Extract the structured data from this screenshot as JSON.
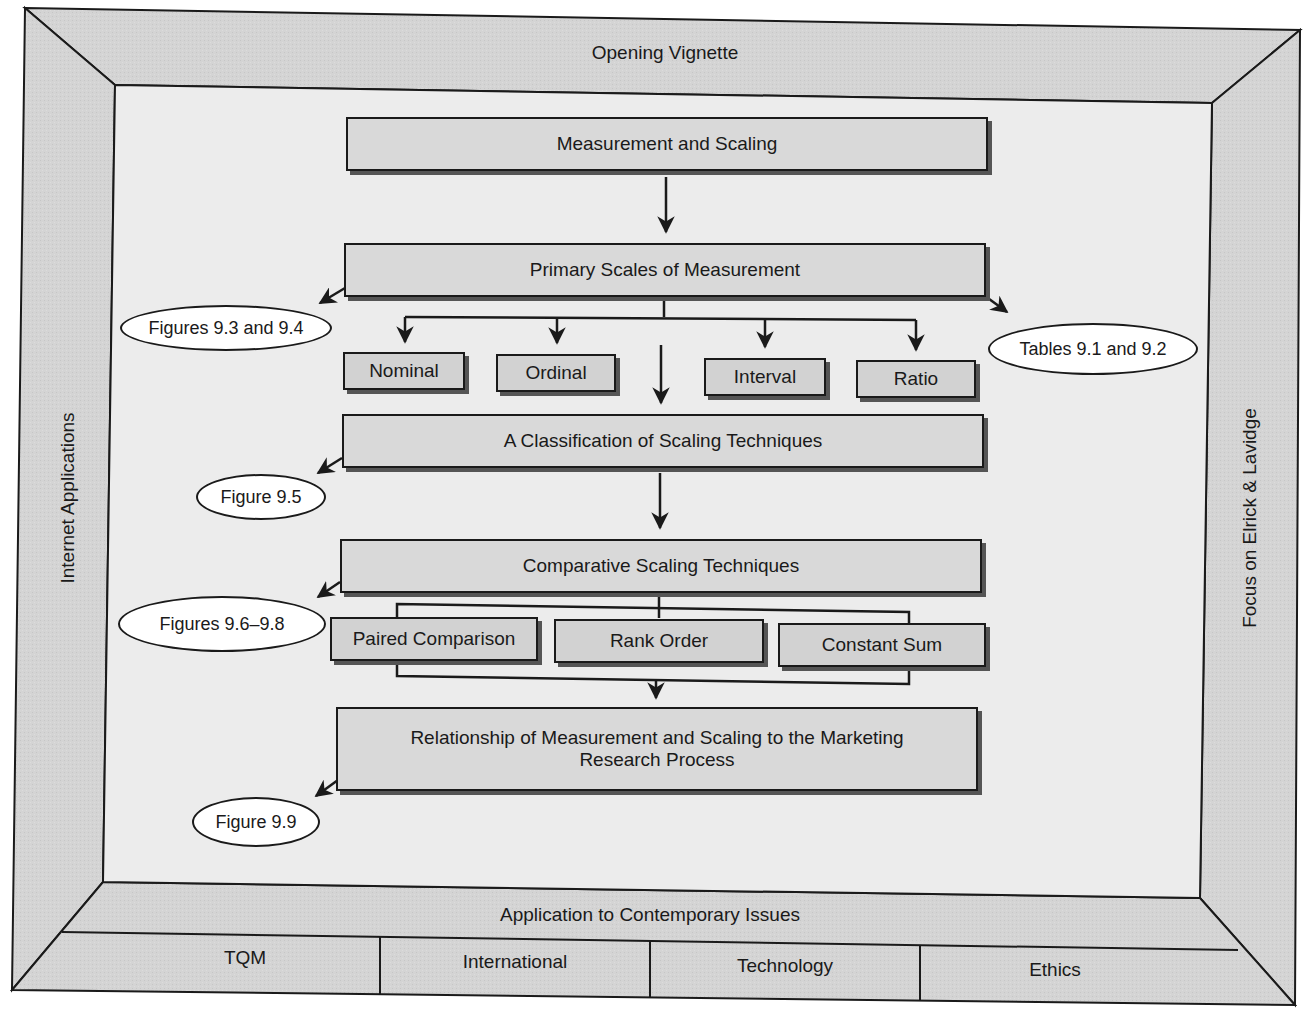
{
  "frame": {
    "top_band": "Opening Vignette",
    "left_band": "Internet Applications",
    "right_band": "Focus on Elrick & Lavidge",
    "bottom_band": "Application to Contemporary Issues",
    "bottom_cells": [
      "TQM",
      "International",
      "Technology",
      "Ethics"
    ]
  },
  "flow": {
    "measurement_and_scaling": "Measurement and Scaling",
    "primary_scales": "Primary Scales of Measurement",
    "scale_types": [
      "Nominal",
      "Ordinal",
      "Interval",
      "Ratio"
    ],
    "classification": "A Classification of Scaling Techniques",
    "comparative": "Comparative Scaling Techniques",
    "comparative_types": [
      "Paired Comparison",
      "Rank Order",
      "Constant Sum"
    ],
    "relationship": "Relationship of Measurement and Scaling to the Marketing Research Process"
  },
  "callouts": {
    "figures_9_3_9_4": "Figures 9.3 and 9.4",
    "tables_9_1_9_2": "Tables 9.1 and 9.2",
    "figure_9_5": "Figure 9.5",
    "figures_9_6_9_8": "Figures 9.6–9.8",
    "figure_9_9": "Figure 9.9"
  },
  "colors": {
    "band_fill": "#d4d4d4",
    "inner_fill": "#ececec",
    "box_fill": "#d9d9d9",
    "line": "#1a1a1a"
  }
}
